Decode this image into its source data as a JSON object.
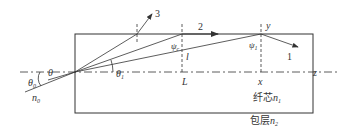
{
  "diagram": {
    "labels": {
      "ray_3": "3",
      "ray_2": "2",
      "ray_1": "1",
      "y": "y",
      "psi_c": "ψ",
      "psi_c_sub": "c",
      "psi_1": "ψ",
      "psi_1_sub": "1",
      "l": "l",
      "L": "L",
      "x": "x",
      "z": "z",
      "theta_0": "θ",
      "theta_0_sub": "0",
      "theta": "θ",
      "theta_1": "θ",
      "theta_1_sub": "1",
      "n_0": "n",
      "n_0_sub": "0",
      "core": "纤芯",
      "core_n": "n",
      "core_n_sub": "1",
      "cladding": "包层",
      "cladding_n": "n",
      "cladding_n_sub": "2"
    },
    "colors": {
      "line": "#333333",
      "background": "#ffffff"
    }
  }
}
